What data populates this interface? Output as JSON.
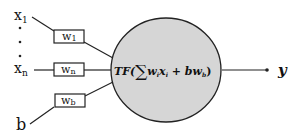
{
  "diagram": {
    "inputs": [
      {
        "label": "x",
        "subscript": "1"
      },
      {
        "label": "x",
        "subscript": "n"
      }
    ],
    "bias": {
      "label": "b"
    },
    "ellipsis": "⋮",
    "weights": [
      {
        "label": "w",
        "subscript": "1"
      },
      {
        "label": "w",
        "subscript": "n"
      },
      {
        "label": "w",
        "subscript": "b"
      }
    ],
    "neuron": {
      "formula_prefix": "TF(",
      "sum_symbol": "∑",
      "term1_w": "w",
      "term1_w_sub": "i",
      "term1_x": "x",
      "term1_x_sub": "i",
      "plus": " + ",
      "term2": "bw",
      "term2_sub": "b",
      "formula_suffix": ")",
      "fill_color": "#d6d6d6",
      "stroke_color": "#222222"
    },
    "output": {
      "label": "y"
    }
  }
}
